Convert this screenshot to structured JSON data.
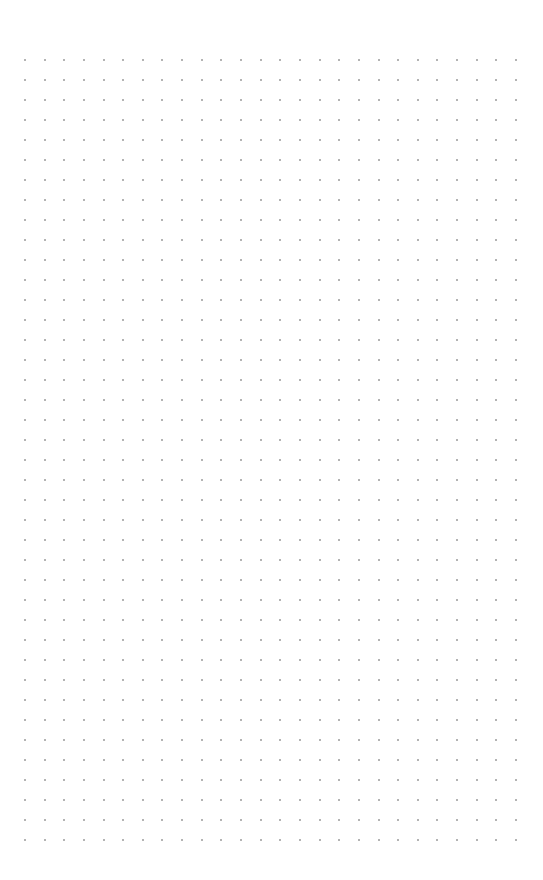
{
  "page": {
    "type": "dot-grid-paper",
    "background": "#ffffff"
  },
  "grid": {
    "rows": 40,
    "columns": 26,
    "origin_x": 25,
    "origin_y": 60,
    "spacing_x": 19.64,
    "spacing_y": 20,
    "dot_size": 2,
    "dot_color": "#9a9a9a"
  }
}
